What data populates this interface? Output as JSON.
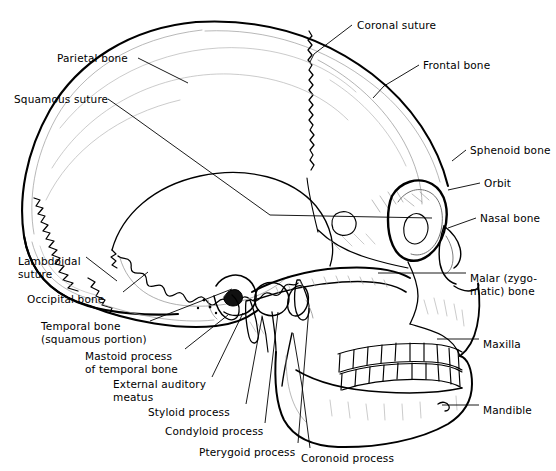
{
  "figure": {
    "background_color": "#ffffff",
    "line_color": "#000000",
    "shade_color": "#7a7a7a",
    "width": 556,
    "height": 471
  },
  "labels": [
    {
      "id": "parietal-bone",
      "text": "Parietal bone",
      "x": 57,
      "y": 52,
      "align": "left"
    },
    {
      "id": "coronal-suture",
      "text": "Coronal suture",
      "x": 357,
      "y": 19,
      "align": "left"
    },
    {
      "id": "frontal-bone",
      "text": "Frontal bone",
      "x": 423,
      "y": 59,
      "align": "left"
    },
    {
      "id": "squamous-suture",
      "text": "Squamous suture",
      "x": 14,
      "y": 93,
      "align": "left"
    },
    {
      "id": "sphenoid-bone",
      "text": "Sphenoid bone",
      "x": 470,
      "y": 144,
      "align": "left"
    },
    {
      "id": "orbit",
      "text": "Orbit",
      "x": 484,
      "y": 177,
      "align": "left"
    },
    {
      "id": "nasal-bone",
      "text": "Nasal bone",
      "x": 480,
      "y": 212,
      "align": "left"
    },
    {
      "id": "lambdoidal-suture",
      "text": "Lambdoidal\nsuture",
      "x": 18,
      "y": 255,
      "align": "left"
    },
    {
      "id": "malar-zygomatic-bone",
      "text": "Malar (zygo-\nmatic) bone",
      "x": 470,
      "y": 272,
      "align": "left"
    },
    {
      "id": "occipital-bone",
      "text": "Occipital bone",
      "x": 27,
      "y": 293,
      "align": "left"
    },
    {
      "id": "temporal-bone",
      "text": "Temporal bone\n(squamous portion)",
      "x": 41,
      "y": 320,
      "align": "left"
    },
    {
      "id": "maxilla",
      "text": "Maxilla",
      "x": 483,
      "y": 338,
      "align": "left"
    },
    {
      "id": "mastoid-process",
      "text": "Mastoid process\nof temporal bone",
      "x": 85,
      "y": 350,
      "align": "left"
    },
    {
      "id": "external-auditory-meatus",
      "text": "External auditory\nmeatus",
      "x": 113,
      "y": 378,
      "align": "left"
    },
    {
      "id": "mandible",
      "text": "Mandible",
      "x": 483,
      "y": 404,
      "align": "left"
    },
    {
      "id": "styloid-process",
      "text": "Styloid process",
      "x": 148,
      "y": 406,
      "align": "left"
    },
    {
      "id": "condyloid-process",
      "text": "Condyloid process",
      "x": 165,
      "y": 425,
      "align": "left"
    },
    {
      "id": "pterygoid-process",
      "text": "Pterygoid process",
      "x": 199,
      "y": 446,
      "align": "left"
    },
    {
      "id": "coronoid-process",
      "text": "Coronoid process",
      "x": 301,
      "y": 452,
      "align": "left"
    }
  ],
  "leader_lines": [
    {
      "id": "leader-parietal-bone",
      "points": "138,58 188,83"
    },
    {
      "id": "leader-coronal-suture",
      "points": "352,25 314,54 310,62"
    },
    {
      "id": "leader-frontal-bone",
      "points": "419,65 384,86 373,98"
    },
    {
      "id": "leader-squamous-suture",
      "points": "108,99 128,113 270,215 432,218"
    },
    {
      "id": "leader-sphenoid-bone",
      "points": "466,150 452,161"
    },
    {
      "id": "leader-orbit",
      "points": "480,183 448,190"
    },
    {
      "id": "leader-nasal-bone",
      "points": "476,218 448,228"
    },
    {
      "id": "leader-lambdoidal-suture",
      "points": "86,257 117,281"
    },
    {
      "id": "leader-malar-zygomatic",
      "points": "466,273 378,273"
    },
    {
      "id": "leader-occipital-bone",
      "points": "123,292 148,272"
    },
    {
      "id": "leader-temporal-bone",
      "points": "150,321 232,289"
    },
    {
      "id": "leader-maxilla",
      "points": "479,339 437,339"
    },
    {
      "id": "leader-mastoid-process",
      "points": "185,349 228,315"
    },
    {
      "id": "leader-external-auditory-meatus",
      "points": "212,377 243,313"
    },
    {
      "id": "leader-mandible",
      "points": "479,405 442,405"
    },
    {
      "id": "leader-styloid-process",
      "points": "246,404 262,317"
    },
    {
      "id": "leader-condyloid-process",
      "points": "265,423 278,312"
    },
    {
      "id": "leader-pterygoid-process",
      "points": "298,443 309,308"
    },
    {
      "id": "leader-coronoid-process",
      "points": "310,448 302,386 293,333"
    }
  ],
  "structures": [
    {
      "id": "cranial-vault",
      "name": "cranial vault outline"
    },
    {
      "id": "coronal-suture-line",
      "name": "coronal suture zigzag"
    },
    {
      "id": "lambdoidal-suture-line",
      "name": "lambdoidal suture zigzag"
    },
    {
      "id": "squamous-suture-line",
      "name": "squamous suture arc"
    },
    {
      "id": "temporal-bone-plate",
      "name": "temporal squamous plate"
    },
    {
      "id": "orbit-socket",
      "name": "orbital socket"
    },
    {
      "id": "nasal-aperture",
      "name": "nasal aperture"
    },
    {
      "id": "zygomatic-arch",
      "name": "zygomatic arch"
    },
    {
      "id": "maxilla-body",
      "name": "maxilla body"
    },
    {
      "id": "mandible-body",
      "name": "mandible body"
    },
    {
      "id": "upper-teeth",
      "name": "upper dental arcade"
    },
    {
      "id": "lower-teeth",
      "name": "lower dental arcade"
    },
    {
      "id": "mastoid",
      "name": "mastoid process"
    },
    {
      "id": "styloid",
      "name": "styloid process"
    },
    {
      "id": "condyle",
      "name": "condyloid process"
    },
    {
      "id": "coronoid",
      "name": "coronoid process"
    },
    {
      "id": "ear-canal",
      "name": "external auditory meatus opening"
    }
  ]
}
